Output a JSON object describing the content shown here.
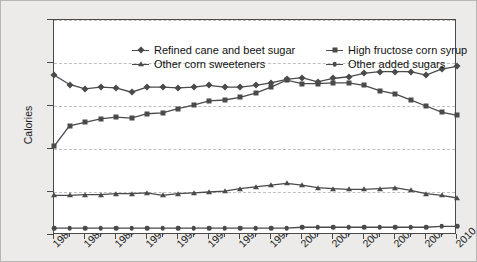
{
  "chart_data": {
    "type": "line",
    "title": "",
    "xlabel": "",
    "ylabel": "Calories",
    "ylim": [
      0,
      250
    ],
    "ytick_values": [
      0,
      50,
      100,
      150,
      200,
      250
    ],
    "ytick_labels": [
      "0.0",
      "50.0",
      "100.0",
      "150.0",
      "200.0",
      "250.0"
    ],
    "xlim": [
      1984,
      2010
    ],
    "x": [
      1984,
      1985,
      1986,
      1987,
      1988,
      1989,
      1990,
      1991,
      1992,
      1993,
      1994,
      1995,
      1996,
      1997,
      1998,
      1999,
      2000,
      2001,
      2002,
      2003,
      2004,
      2005,
      2006,
      2007,
      2008,
      2009,
      2010
    ],
    "xtick_labels": [
      "1984",
      "1986",
      "1988",
      "1990",
      "1992",
      "1994",
      "1996",
      "1998",
      "2000",
      "2002",
      "2004",
      "2006",
      "2008",
      "2010"
    ],
    "xtick_label_years": [
      1984,
      1986,
      1988,
      1990,
      1992,
      1994,
      1996,
      1998,
      2000,
      2002,
      2004,
      2006,
      2008,
      2010
    ],
    "grid": "horizontal-dashed",
    "legend_position": "top-inside",
    "series": [
      {
        "name": "Refined cane and beet sugar",
        "marker": "diamond",
        "color": "#4a4a4a",
        "values": [
          186,
          175,
          170,
          172,
          171,
          166,
          172,
          172,
          171,
          172,
          174,
          172,
          172,
          174,
          177,
          181,
          183,
          178,
          182,
          184,
          188,
          190,
          190,
          190,
          186,
          193,
          196
        ]
      },
      {
        "name": "High fructose corn syrup",
        "marker": "square",
        "color": "#4a4a4a",
        "values": [
          103,
          127,
          131,
          135,
          137,
          136,
          141,
          142,
          147,
          151,
          156,
          157,
          160,
          165,
          172,
          180,
          176,
          176,
          177,
          177,
          174,
          168,
          164,
          157,
          150,
          143,
          139
        ]
      },
      {
        "name": "Other corn sweeteners",
        "marker": "triangle",
        "color": "#4a4a4a",
        "values": [
          46,
          46,
          47,
          47,
          48,
          48,
          49,
          46,
          48,
          49,
          50,
          51,
          54,
          56,
          58,
          60,
          58,
          55,
          54,
          53,
          53,
          54,
          55,
          52,
          48,
          46,
          43
        ]
      },
      {
        "name": "Other added sugars",
        "marker": "circle",
        "color": "#4a4a4a",
        "values": [
          8,
          8,
          8,
          8,
          8,
          8,
          8,
          8,
          8,
          8,
          8,
          8,
          8,
          8,
          8,
          8,
          9,
          9,
          9,
          9,
          9,
          9,
          9,
          9,
          9,
          10,
          10
        ]
      }
    ]
  },
  "legend": {
    "items": [
      "Refined cane and beet sugar",
      "High fructose corn syrup",
      "Other corn sweeteners",
      "Other added sugars"
    ]
  }
}
